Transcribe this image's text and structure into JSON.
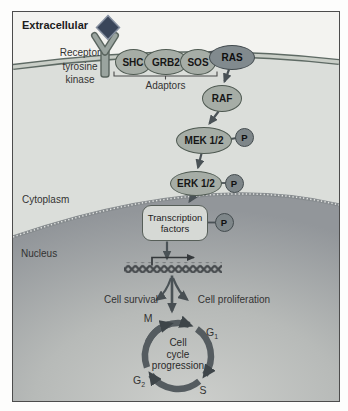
{
  "panel": {
    "regions": {
      "extracellular": "Extracellular",
      "cytoplasm": "Cytoplasm",
      "nucleus": "Nucleus"
    },
    "receptor": {
      "line1": "Receptor",
      "line2": "tyrosine",
      "line3": "kinase"
    },
    "adaptors": {
      "label": "Adaptors",
      "shc": "SHC",
      "grb2": "GRB2",
      "sos": "SOS"
    },
    "cascade": {
      "ras": "RAS",
      "raf": "RAF",
      "mek": "MEK 1/2",
      "erk": "ERK 1/2"
    },
    "phosphate": "P",
    "transcription_factors": {
      "line1": "Transcription",
      "line2": "factors"
    },
    "outcomes": {
      "survival": "Cell survival",
      "proliferation": "Cell proliferation"
    },
    "cell_cycle": {
      "center_line1": "Cell",
      "center_line2": "cycle",
      "center_line3": "progression",
      "phase_m": "M",
      "phase_g1": {
        "letter": "G",
        "sub": "1"
      },
      "phase_s": "S",
      "phase_g2": {
        "letter": "G",
        "sub": "2"
      }
    },
    "colors": {
      "oval_fill": "#a6ada6",
      "oval_border": "#4f5a52",
      "ras_fill": "#818a8e",
      "phosphate_fill": "#7e8689",
      "membrane_line": "#5e6a64",
      "cytoplasm_bg": "#dbdeda",
      "nucleus_dark": "#92969a",
      "nucleus_light": "#cdcfcc",
      "arrow": "#4a5256",
      "ligand": "#3a465a"
    }
  }
}
